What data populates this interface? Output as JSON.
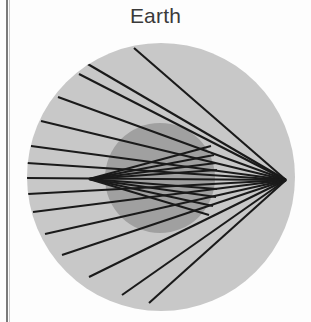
{
  "figure": {
    "title": "Earth",
    "kind": "ray-tracing-diagram",
    "caption_text": "Earth"
  },
  "colors": {
    "background": "#fdfdfd",
    "outer_disk_fill": "#c8c8c8",
    "inner_disk_fill": "#a0a0a0",
    "ray_stroke": "#1a1a1a",
    "title_text": "#3a3a3a",
    "page_rule": "#7a7a7a"
  },
  "geometry": {
    "canvas": {
      "width": 311,
      "height": 322
    },
    "outer_disk": {
      "cx": 161,
      "cy": 177,
      "r": 134,
      "label": "atmosphere-disk"
    },
    "inner_disk": {
      "cx": 160,
      "cy": 178,
      "r": 55,
      "label": "earth-disk"
    },
    "left_focus": {
      "x": 89,
      "y": 179,
      "label": "left-caustic-cusp"
    },
    "right_focus": {
      "x": 286,
      "y": 180,
      "label": "right-focal-point"
    },
    "stroke_width": 2.1
  },
  "chart_data": {
    "type": "scatter",
    "title": "Earth",
    "xlabel": "",
    "ylabel": "",
    "grid": false,
    "legend": "none",
    "rays": [
      {
        "id": "ray-1",
        "x1": 134,
        "y1": 48,
        "x2": 286,
        "y2": 180,
        "group": "upper-left-fan"
      },
      {
        "id": "ray-2",
        "x1": 86,
        "y1": 63,
        "x2": 286,
        "y2": 180,
        "group": "upper-left-fan"
      },
      {
        "id": "ray-3",
        "x1": 79,
        "y1": 74,
        "x2": 286,
        "y2": 180,
        "group": "upper-left-fan"
      },
      {
        "id": "ray-4",
        "x1": 58,
        "y1": 97,
        "x2": 286,
        "y2": 180,
        "group": "upper-left-fan"
      },
      {
        "id": "ray-5",
        "x1": 41,
        "y1": 121,
        "x2": 286,
        "y2": 180,
        "group": "upper-left-fan"
      },
      {
        "id": "ray-6",
        "x1": 31,
        "y1": 146,
        "x2": 286,
        "y2": 180,
        "group": "upper-left-fan"
      },
      {
        "id": "ray-7",
        "x1": 27,
        "y1": 163,
        "x2": 286,
        "y2": 180,
        "group": "upper-left-fan"
      },
      {
        "id": "ray-8",
        "x1": 26,
        "y1": 178,
        "x2": 286,
        "y2": 180,
        "group": "axis-ray"
      },
      {
        "id": "ray-9",
        "x1": 28,
        "y1": 194,
        "x2": 286,
        "y2": 180,
        "group": "lower-left-fan"
      },
      {
        "id": "ray-10",
        "x1": 33,
        "y1": 212,
        "x2": 286,
        "y2": 180,
        "group": "lower-left-fan"
      },
      {
        "id": "ray-11",
        "x1": 45,
        "y1": 234,
        "x2": 286,
        "y2": 180,
        "group": "lower-left-fan"
      },
      {
        "id": "ray-12",
        "x1": 62,
        "y1": 255,
        "x2": 286,
        "y2": 180,
        "group": "lower-left-fan"
      },
      {
        "id": "ray-13",
        "x1": 89,
        "y1": 277,
        "x2": 286,
        "y2": 180,
        "group": "lower-left-fan"
      },
      {
        "id": "ray-14",
        "x1": 122,
        "y1": 295,
        "x2": 286,
        "y2": 180,
        "group": "lower-left-fan"
      },
      {
        "id": "ray-15",
        "x1": 149,
        "y1": 303,
        "x2": 286,
        "y2": 180,
        "group": "lower-left-fan"
      },
      {
        "id": "ray-16",
        "x1": 89,
        "y1": 179,
        "x2": 211,
        "y2": 146,
        "group": "right-upper-bundle"
      },
      {
        "id": "ray-17",
        "x1": 89,
        "y1": 179,
        "x2": 214,
        "y2": 155,
        "group": "right-upper-bundle"
      },
      {
        "id": "ray-18",
        "x1": 89,
        "y1": 179,
        "x2": 216,
        "y2": 163,
        "group": "right-upper-bundle"
      },
      {
        "id": "ray-19",
        "x1": 89,
        "y1": 179,
        "x2": 217,
        "y2": 170,
        "group": "right-upper-bundle"
      },
      {
        "id": "ray-20",
        "x1": 89,
        "y1": 179,
        "x2": 217,
        "y2": 189,
        "group": "right-lower-bundle"
      },
      {
        "id": "ray-21",
        "x1": 89,
        "y1": 179,
        "x2": 216,
        "y2": 197,
        "group": "right-lower-bundle"
      },
      {
        "id": "ray-22",
        "x1": 89,
        "y1": 179,
        "x2": 213,
        "y2": 206,
        "group": "right-lower-bundle"
      },
      {
        "id": "ray-23",
        "x1": 89,
        "y1": 179,
        "x2": 209,
        "y2": 215,
        "group": "right-lower-bundle"
      }
    ],
    "focal_points": [
      {
        "name": "left-caustic-cusp",
        "x": 89,
        "y": 179
      },
      {
        "name": "right-focal-point",
        "x": 286,
        "y": 180
      }
    ]
  }
}
